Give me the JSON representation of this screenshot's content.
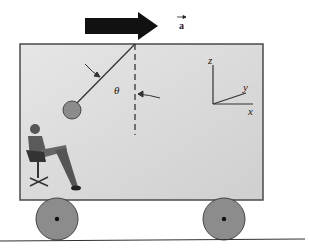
{
  "diagram": {
    "acceleration_label": "a",
    "angle_label": "θ",
    "axes": {
      "z": "z",
      "y": "y",
      "x": "x"
    },
    "colors": {
      "truck_fill": "#dcdcdc",
      "truck_stroke": "#4a4a4a",
      "arrow": "#111111",
      "wheel": "#8c8c8c",
      "bob": "#8c8c8c",
      "ground": "#333333"
    },
    "elements": [
      "acceleration-arrow",
      "truck-box",
      "pendulum-string",
      "pendulum-bob",
      "vertical-dashed-reference",
      "angle-theta",
      "coordinate-axes",
      "seated-observer",
      "front-wheel",
      "rear-wheel",
      "ground-line"
    ]
  }
}
